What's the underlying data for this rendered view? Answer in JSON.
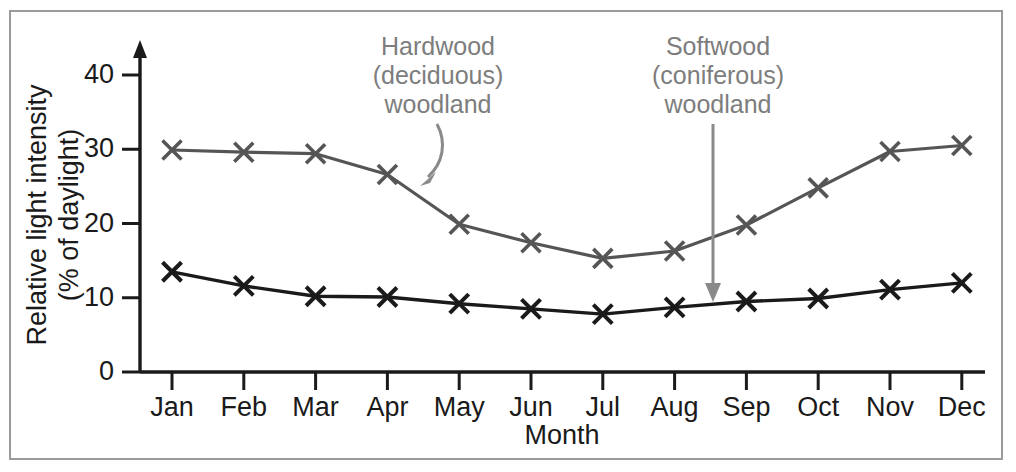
{
  "chart_data": {
    "type": "line",
    "title": "",
    "xlabel": "Month",
    "ylabel": "Relative light intensity\n(% of daylight)",
    "ylabel_line1": "Relative light intensity",
    "ylabel_line2": "(% of daylight)",
    "categories": [
      "Jan",
      "Feb",
      "Mar",
      "Apr",
      "May",
      "Jun",
      "Jul",
      "Aug",
      "Sep",
      "Oct",
      "Nov",
      "Dec"
    ],
    "ylim": [
      0,
      45
    ],
    "yticks": [
      0,
      10,
      20,
      30,
      40
    ],
    "ytick_labels": [
      "0",
      "10",
      "20",
      "30",
      "40"
    ],
    "grid": false,
    "legend": "none",
    "marker": "x",
    "series": [
      {
        "name": "Hardwood (deciduous) woodland",
        "color": "#555555",
        "values": [
          29.9,
          29.6,
          29.4,
          26.6,
          19.9,
          17.4,
          15.3,
          16.3,
          19.8,
          24.8,
          29.7,
          30.5
        ]
      },
      {
        "name": "Softwood (coniferous) woodland",
        "color": "#1a1a1a",
        "values": [
          13.5,
          11.6,
          10.2,
          10.1,
          9.2,
          8.5,
          7.8,
          8.7,
          9.5,
          9.9,
          11.1,
          12.0
        ]
      }
    ],
    "annotations": [
      {
        "id": "hardwood",
        "lines": [
          "Hardwood",
          "(deciduous)",
          "woodland"
        ],
        "color": "#7d7d7d",
        "arrow": "curved-down-left"
      },
      {
        "id": "softwood",
        "lines": [
          "Softwood",
          "(coniferous)",
          "woodland"
        ],
        "color": "#7d7d7d",
        "arrow": "straight-down"
      }
    ]
  },
  "figure": {
    "border_color": "#9a9a9a",
    "background": "#ffffff",
    "axis_color": "#1a1a1a"
  }
}
